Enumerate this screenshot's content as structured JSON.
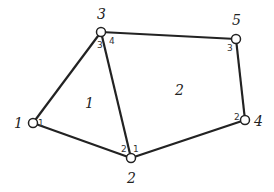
{
  "diagram": {
    "nodes": [
      {
        "id": "1",
        "x": 33,
        "y": 123,
        "label": "1",
        "lx": 14,
        "ly": 128
      },
      {
        "id": "2",
        "x": 131,
        "y": 158,
        "label": "2",
        "lx": 127,
        "ly": 183
      },
      {
        "id": "3",
        "x": 101,
        "y": 32,
        "label": "3",
        "lx": 97,
        "ly": 19
      },
      {
        "id": "4",
        "x": 245,
        "y": 120,
        "label": "4",
        "lx": 254,
        "ly": 126
      },
      {
        "id": "5",
        "x": 236,
        "y": 39,
        "label": "5",
        "lx": 232,
        "ly": 25
      }
    ],
    "edges": [
      {
        "from": "1",
        "to": "3"
      },
      {
        "from": "1",
        "to": "2"
      },
      {
        "from": "3",
        "to": "2"
      },
      {
        "from": "3",
        "to": "5"
      },
      {
        "from": "5",
        "to": "4"
      },
      {
        "from": "4",
        "to": "2"
      }
    ],
    "elements": [
      {
        "label": "1",
        "x": 85,
        "y": 108
      },
      {
        "label": "2",
        "x": 175,
        "y": 95
      }
    ],
    "local_indices": [
      {
        "label": "1",
        "x": 38,
        "y": 126
      },
      {
        "label": "2",
        "x": 121,
        "y": 152
      },
      {
        "label": "1",
        "x": 133,
        "y": 152
      },
      {
        "label": "3",
        "x": 97,
        "y": 48
      },
      {
        "label": "4",
        "x": 109,
        "y": 44
      },
      {
        "label": "3",
        "x": 227,
        "y": 51
      },
      {
        "label": "2",
        "x": 234,
        "y": 120
      }
    ]
  }
}
